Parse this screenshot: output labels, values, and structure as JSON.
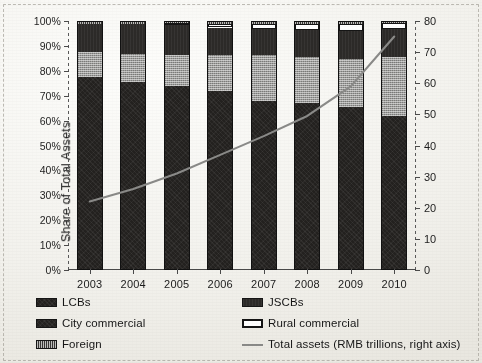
{
  "chart_data": {
    "type": "bar",
    "subtype": "stacked-bar-with-line",
    "title": "",
    "xlabel": "",
    "ylabel": "Share of Total Assets",
    "categories": [
      "2003",
      "2004",
      "2005",
      "2006",
      "2007",
      "2008",
      "2009",
      "2010"
    ],
    "ylim": [
      0,
      100
    ],
    "yticks": [
      "0%",
      "10%",
      "20%",
      "30%",
      "40%",
      "50%",
      "60%",
      "70%",
      "80%",
      "90%",
      "100%"
    ],
    "y2lim": [
      0,
      80
    ],
    "y2ticks": [
      "0",
      "10",
      "20",
      "30",
      "40",
      "50",
      "60",
      "70",
      "80"
    ],
    "y2label": "",
    "grid": false,
    "legend_position": "bottom",
    "stack_order": [
      "LCBs",
      "City commercial",
      "JSCBs",
      "Rural commercial",
      "Foreign"
    ],
    "series": [
      {
        "name": "LCBs",
        "axis": "left",
        "unit": "%",
        "values": [
          77.0,
          75.0,
          73.5,
          71.5,
          67.5,
          66.5,
          65.0,
          61.5
        ]
      },
      {
        "name": "City commercial",
        "axis": "left",
        "unit": "%",
        "values": [
          10.0,
          11.5,
          12.5,
          14.5,
          18.5,
          18.5,
          19.5,
          23.5
        ]
      },
      {
        "name": "JSCBs",
        "axis": "left",
        "unit": "%",
        "values": [
          11.5,
          12.0,
          12.0,
          11.0,
          10.5,
          11.0,
          11.0,
          11.5
        ]
      },
      {
        "name": "Rural commercial",
        "axis": "left",
        "unit": "%",
        "values": [
          0.0,
          0.0,
          0.8,
          1.6,
          2.0,
          2.5,
          3.0,
          2.5
        ]
      },
      {
        "name": "Foreign",
        "axis": "left",
        "unit": "%",
        "values": [
          1.5,
          1.5,
          1.2,
          1.4,
          1.5,
          1.5,
          1.5,
          1.0
        ]
      },
      {
        "name": "Total assets (RMB trillions, right axis)",
        "axis": "right",
        "unit": "RMB trillions",
        "type": "line",
        "values": [
          22,
          26,
          31,
          37,
          43,
          49.5,
          59,
          75
        ]
      }
    ]
  },
  "axes": {
    "y_label": "Share of Total Assets",
    "y_ticks": [
      "100%",
      "90%",
      "80%",
      "70%",
      "60%",
      "50%",
      "40%",
      "30%",
      "20%",
      "10%",
      "0%"
    ],
    "y2_ticks": [
      "80",
      "70",
      "60",
      "50",
      "40",
      "30",
      "20",
      "10",
      "0"
    ],
    "x_ticks": [
      "2003",
      "2004",
      "2005",
      "2006",
      "2007",
      "2008",
      "2009",
      "2010"
    ]
  },
  "legend": {
    "left_column": [
      {
        "label": "LCBs",
        "swatch": "dark-fill-swatch"
      },
      {
        "label": "City commercial",
        "swatch": "dark-fill-swatch"
      },
      {
        "label": "Foreign",
        "swatch": "hatched-fill-swatch"
      }
    ],
    "right_column": [
      {
        "label": "JSCBs",
        "swatch": "dark-fill-swatch"
      },
      {
        "label": "Rural commercial",
        "swatch": "white-fill-swatch"
      },
      {
        "label": "Total assets (RMB trillions, right axis)",
        "swatch": "line-swatch"
      }
    ]
  },
  "colors": {
    "lcbs": "#23211f",
    "city_commercial": "#9d9d9b",
    "jscbs": "#2c2a28",
    "rural_commercial": "#ffffff",
    "foreign": "#555350",
    "total_assets_line": "#8a8a88",
    "axis": "#4a4a4a",
    "background": "#f2f1ec"
  }
}
